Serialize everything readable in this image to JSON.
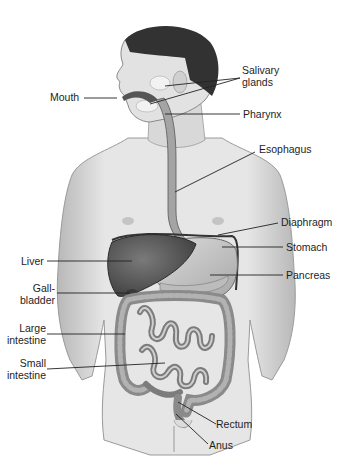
{
  "diagram": {
    "colors": {
      "background": "#ffffff",
      "skin": "#e4e4e4",
      "skin_shade": "#bdbdbd",
      "hair": "#2f2f2f",
      "liver": "#5a5a5a",
      "organ_mid": "#9a9a9a",
      "organ_light": "#cfcfcf",
      "leader_line": "#222222"
    },
    "labels": {
      "salivary_glands": {
        "line1": "Salivary",
        "line2": "glands"
      },
      "mouth": "Mouth",
      "pharynx": "Pharynx",
      "esophagus": "Esophagus",
      "diaphragm": "Diaphragm",
      "stomach": "Stomach",
      "liver": "Liver",
      "pancreas": "Pancreas",
      "gallbladder": {
        "line1": "Gall-",
        "line2": "bladder"
      },
      "large_intestine": {
        "line1": "Large",
        "line2": "intestine"
      },
      "small_intestine": {
        "line1": "Small",
        "line2": "intestine"
      },
      "rectum": "Rectum",
      "anus": "Anus"
    }
  }
}
